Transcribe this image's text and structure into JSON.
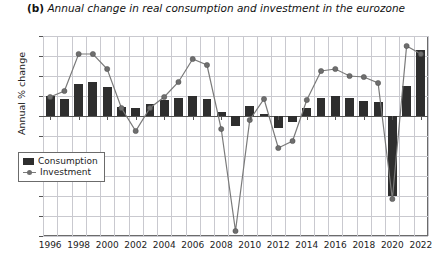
{
  "chart_data": {
    "type": "bar",
    "title": "Annual change in real consumption and investment in the eurozone",
    "panel_tag": "(b)",
    "xlabel": "",
    "ylabel": "Annual % change",
    "ylim": [
      -12,
      8
    ],
    "ytick_step": 2,
    "yticks": [
      "8",
      "6",
      "4",
      "2",
      "0",
      "-2",
      "-4",
      "-6",
      "-8",
      "-10",
      "-12"
    ],
    "grid": true,
    "legend_position": "bottom-left",
    "categories": [
      1996,
      1997,
      1998,
      1999,
      2000,
      2001,
      2002,
      2003,
      2004,
      2005,
      2006,
      2007,
      2008,
      2009,
      2010,
      2011,
      2012,
      2013,
      2014,
      2015,
      2016,
      2017,
      2018,
      2019,
      2020,
      2021,
      2022
    ],
    "xtick_labels": [
      "1996",
      "1998",
      "2000",
      "2002",
      "2004",
      "2006",
      "2008",
      "2010",
      "2012",
      "2014",
      "2016",
      "2018",
      "2020",
      "2022"
    ],
    "series": [
      {
        "name": "Consumption",
        "kind": "bar",
        "color": "#2e2e2e",
        "values": [
          2.0,
          1.7,
          3.2,
          3.4,
          2.9,
          0.9,
          0.8,
          1.2,
          1.6,
          1.8,
          2.0,
          1.7,
          0.4,
          -1.0,
          1.0,
          0.2,
          -1.2,
          -0.6,
          0.8,
          1.8,
          2.0,
          1.8,
          1.5,
          1.4,
          -8.0,
          3.0,
          6.6
        ]
      },
      {
        "name": "Investment",
        "kind": "line",
        "color": "#7a7a7a",
        "marker": "circle",
        "values": [
          1.9,
          2.5,
          6.2,
          6.2,
          4.7,
          0.8,
          -1.5,
          0.8,
          1.9,
          3.4,
          5.7,
          5.1,
          -1.3,
          -11.5,
          -0.4,
          1.7,
          -3.2,
          -2.5,
          1.6,
          4.5,
          4.7,
          4.0,
          3.9,
          3.3,
          -8.3,
          7.0,
          6.2
        ]
      }
    ]
  },
  "legend": {
    "items": [
      {
        "label": "Consumption"
      },
      {
        "label": "Investment"
      }
    ]
  }
}
